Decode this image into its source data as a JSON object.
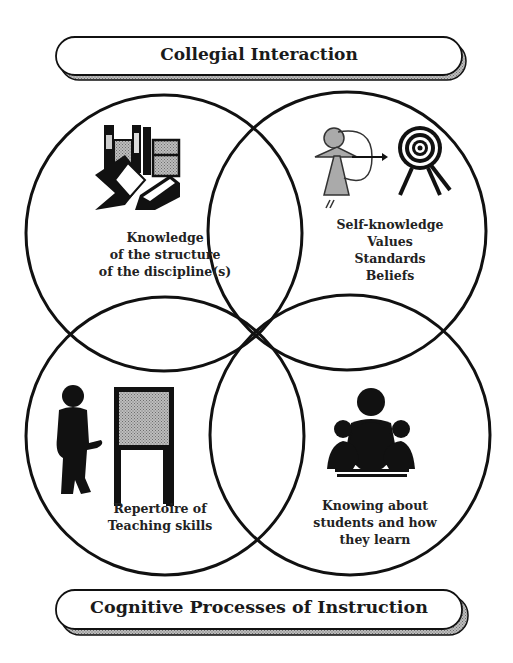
{
  "banners": {
    "top": "Collegial Interaction",
    "bottom": "Cognitive Processes of Instruction"
  },
  "circles": [
    {
      "id": "top-left",
      "icon": "books-icon",
      "lines": [
        "Knowledge",
        "of the structure",
        "of the discipline(s)"
      ]
    },
    {
      "id": "top-right",
      "icon": "archer-and-target-icon",
      "lines": [
        "Self-knowledge",
        "Values",
        "Standards",
        "Beliefs"
      ]
    },
    {
      "id": "bottom-left",
      "icon": "teacher-at-easel-icon",
      "lines": [
        "Repertoire of",
        "Teaching skills"
      ]
    },
    {
      "id": "bottom-right",
      "icon": "teacher-with-students-icon",
      "lines": [
        "Knowing about",
        "students and how",
        "they learn"
      ]
    }
  ],
  "colors": {
    "stroke": "#111111",
    "shade": "#a8a8a8",
    "background": "#ffffff"
  }
}
